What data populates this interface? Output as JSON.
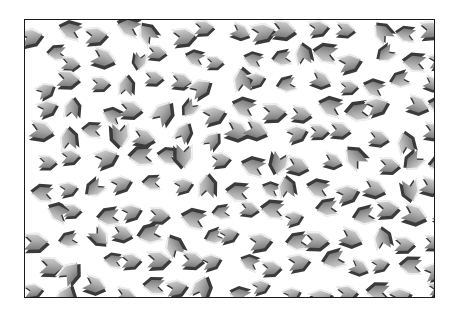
{
  "image": {
    "description": "Scattered 3D gray chevron shapes on a white field inside a thin black frame",
    "frame": {
      "x": 24,
      "y": 19,
      "width": 409,
      "height": 277,
      "border_color": "#1a1a1a"
    },
    "background": "#ffffff",
    "colors": {
      "face_light": "#d2d2d2",
      "face_mid": "#a6a6a6",
      "face_dark": "#7d7d7d",
      "rim": "#3a3a3a",
      "highlight": "#f4f4f4"
    },
    "grid": {
      "cols": 15,
      "rows": 11,
      "cell_w": 28,
      "cell_h": 26,
      "seed": 7
    }
  }
}
